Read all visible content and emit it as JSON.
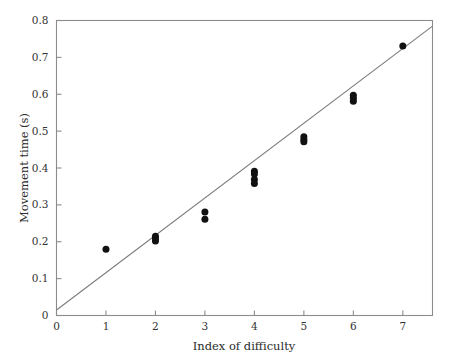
{
  "chart_data": {
    "type": "scatter",
    "title": "",
    "xlabel": "Index of difficulty",
    "ylabel": "Movement time (s)",
    "xlim": [
      0,
      7.6
    ],
    "ylim": [
      0,
      0.8
    ],
    "xticks": [
      0,
      1,
      2,
      3,
      4,
      5,
      6,
      7
    ],
    "xtick_labels": [
      "0",
      "1",
      "2",
      "3",
      "4",
      "5",
      "6",
      "7"
    ],
    "yticks": [
      0,
      0.1,
      0.2,
      0.3,
      0.4,
      0.5,
      0.6,
      0.7,
      0.8
    ],
    "ytick_labels": [
      "0",
      "0.1",
      "0.2",
      "0.3",
      "0.4",
      "0.5",
      "0.6",
      "0.7",
      "0.8"
    ],
    "grid": false,
    "legend": null,
    "marker": "filled-circle",
    "marker_color": "#111111",
    "points": [
      {
        "x": 1,
        "y": 0.18
      },
      {
        "x": 2,
        "y": 0.215
      },
      {
        "x": 2,
        "y": 0.208
      },
      {
        "x": 2,
        "y": 0.202
      },
      {
        "x": 3,
        "y": 0.281
      },
      {
        "x": 3,
        "y": 0.261
      },
      {
        "x": 4,
        "y": 0.391
      },
      {
        "x": 4,
        "y": 0.384
      },
      {
        "x": 4,
        "y": 0.369
      },
      {
        "x": 4,
        "y": 0.358
      },
      {
        "x": 5,
        "y": 0.485
      },
      {
        "x": 5,
        "y": 0.477
      },
      {
        "x": 5,
        "y": 0.471
      },
      {
        "x": 6,
        "y": 0.597
      },
      {
        "x": 6,
        "y": 0.589
      },
      {
        "x": 6,
        "y": 0.581
      },
      {
        "x": 7,
        "y": 0.731
      }
    ],
    "fit_line": {
      "type": "linear-regression",
      "intercept": 0.015,
      "slope": 0.1013,
      "x_start": 0,
      "x_end": 7.6,
      "color": "#7a7a7a"
    }
  }
}
